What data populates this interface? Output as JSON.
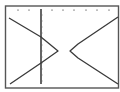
{
  "screen": {
    "type": "graphing-calculator-display",
    "background": "#ffffff",
    "ink": "#3a3a3a"
  },
  "chart_data": {
    "type": "line",
    "title": "",
    "xlabel": "",
    "ylabel": "",
    "grid": false,
    "legend": null,
    "series": [
      {
        "name": "left-branch",
        "points_px": [
          [
            9,
            18
          ],
          [
            41,
            37
          ],
          [
            58,
            51
          ],
          [
            41,
            63
          ],
          [
            10,
            84
          ]
        ]
      },
      {
        "name": "right-branch",
        "points_px": [
          [
            118,
            17
          ],
          [
            78,
            44
          ],
          [
            70,
            51
          ],
          [
            78,
            58
          ],
          [
            118,
            84
          ]
        ]
      }
    ],
    "axes": {
      "y_axis_x_px": 41,
      "top_tick_x_px": [
        18,
        29,
        52,
        63,
        74,
        86,
        97,
        109
      ],
      "y_axis_tick_y_px": [
        15,
        21,
        27,
        33,
        39,
        45,
        51,
        57,
        63,
        69,
        75,
        81
      ]
    }
  }
}
